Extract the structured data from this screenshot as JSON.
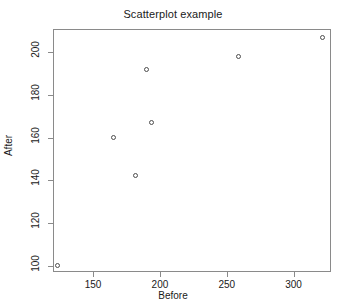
{
  "chart_data": {
    "type": "scatter",
    "title": "Scatterplot example",
    "xlabel": "Before",
    "ylabel": "After",
    "xlim": [
      120,
      328
    ],
    "ylim": [
      97,
      211
    ],
    "xticks": [
      150,
      200,
      250,
      300
    ],
    "yticks": [
      100,
      120,
      140,
      160,
      180,
      200
    ],
    "grid": false,
    "legend": null,
    "marker": "open-circle",
    "marker_color": "#4d4d4d",
    "points": [
      {
        "x": 124,
        "y": 100
      },
      {
        "x": 166,
        "y": 160
      },
      {
        "x": 182,
        "y": 142
      },
      {
        "x": 190,
        "y": 192
      },
      {
        "x": 194,
        "y": 167
      },
      {
        "x": 259,
        "y": 198
      },
      {
        "x": 322,
        "y": 207
      }
    ]
  },
  "axes": {
    "box_color": "#8a8a8a"
  }
}
